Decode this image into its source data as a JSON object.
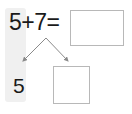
{
  "worksheet": {
    "equation": {
      "first_addend": "5",
      "plus_operator": "+",
      "second_addend": "7",
      "equals_operator": "=",
      "full_text": "5+7="
    },
    "sum_box": {
      "value": "",
      "placeholder": ""
    },
    "decomposition": {
      "known_part": "5",
      "unknown_part_box": {
        "value": "",
        "placeholder": ""
      }
    },
    "colors": {
      "text": "#1a1a1a",
      "box_border": "#b8b8b8",
      "arrow": "#8a8a8a",
      "highlight": "#f0f0f0",
      "background": "#ffffff"
    }
  }
}
